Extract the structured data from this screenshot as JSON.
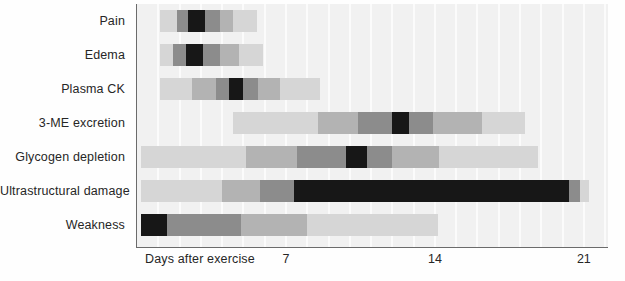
{
  "chart_data": {
    "type": "bar",
    "chart_style": "horizontal-gantt-intensity",
    "title": "",
    "xlabel": "Days after exercise",
    "ylabel": "",
    "xlim": [
      0,
      22.1
    ],
    "grid": true,
    "grid_interval_days": 1,
    "legend": "none",
    "axis_caption": "Days after exercise",
    "xticks": [
      7,
      14,
      21
    ],
    "xtick_labels": [
      "7",
      "14",
      "21"
    ],
    "categories": [
      "Pain",
      "Edema",
      "Plasma CK",
      "3-ME excretion",
      "Glycogen depletion",
      "Ultrastructural damage",
      "Weakness"
    ],
    "intensity_levels": {
      "none": "#f1f1f1",
      "low": "#d6d6d6",
      "moderate": "#b3b3b3",
      "high": "#8c8c8c",
      "peak": "#171717"
    },
    "series": [
      {
        "name": "Pain",
        "start_day": 1.1,
        "end_day": 5.6,
        "segments": [
          {
            "start_day": 1.1,
            "end_day": 1.9,
            "level": "low",
            "color": "#d6d6d6"
          },
          {
            "start_day": 1.9,
            "end_day": 2.4,
            "level": "high",
            "color": "#8c8c8c"
          },
          {
            "start_day": 2.4,
            "end_day": 3.2,
            "level": "peak",
            "color": "#171717"
          },
          {
            "start_day": 3.2,
            "end_day": 3.9,
            "level": "high",
            "color": "#8c8c8c"
          },
          {
            "start_day": 3.9,
            "end_day": 4.5,
            "level": "moderate",
            "color": "#b3b3b3"
          },
          {
            "start_day": 4.5,
            "end_day": 5.6,
            "level": "low",
            "color": "#d6d6d6"
          }
        ]
      },
      {
        "name": "Edema",
        "start_day": 1.1,
        "end_day": 5.9,
        "segments": [
          {
            "start_day": 1.1,
            "end_day": 1.7,
            "level": "low",
            "color": "#d6d6d6"
          },
          {
            "start_day": 1.7,
            "end_day": 2.3,
            "level": "high",
            "color": "#8c8c8c"
          },
          {
            "start_day": 2.3,
            "end_day": 3.1,
            "level": "peak",
            "color": "#171717"
          },
          {
            "start_day": 3.1,
            "end_day": 3.9,
            "level": "high",
            "color": "#8c8c8c"
          },
          {
            "start_day": 3.9,
            "end_day": 4.8,
            "level": "moderate",
            "color": "#b3b3b3"
          },
          {
            "start_day": 4.8,
            "end_day": 5.9,
            "level": "low",
            "color": "#d6d6d6"
          }
        ]
      },
      {
        "name": "Plasma CK",
        "start_day": 1.1,
        "end_day": 8.6,
        "segments": [
          {
            "start_day": 1.1,
            "end_day": 2.6,
            "level": "low",
            "color": "#d6d6d6"
          },
          {
            "start_day": 2.6,
            "end_day": 3.7,
            "level": "moderate",
            "color": "#b3b3b3"
          },
          {
            "start_day": 3.7,
            "end_day": 4.3,
            "level": "high",
            "color": "#8c8c8c"
          },
          {
            "start_day": 4.3,
            "end_day": 5.0,
            "level": "peak",
            "color": "#171717"
          },
          {
            "start_day": 5.0,
            "end_day": 5.7,
            "level": "high",
            "color": "#8c8c8c"
          },
          {
            "start_day": 5.7,
            "end_day": 6.7,
            "level": "moderate",
            "color": "#b3b3b3"
          },
          {
            "start_day": 6.7,
            "end_day": 8.6,
            "level": "low",
            "color": "#d6d6d6"
          }
        ]
      },
      {
        "name": "3-ME excretion",
        "start_day": 4.5,
        "end_day": 18.2,
        "segments": [
          {
            "start_day": 4.5,
            "end_day": 8.5,
            "level": "low",
            "color": "#d6d6d6"
          },
          {
            "start_day": 8.5,
            "end_day": 10.4,
            "level": "moderate",
            "color": "#b3b3b3"
          },
          {
            "start_day": 10.4,
            "end_day": 12.0,
            "level": "high",
            "color": "#8c8c8c"
          },
          {
            "start_day": 12.0,
            "end_day": 12.8,
            "level": "peak",
            "color": "#171717"
          },
          {
            "start_day": 12.8,
            "end_day": 13.9,
            "level": "high",
            "color": "#8c8c8c"
          },
          {
            "start_day": 13.9,
            "end_day": 16.2,
            "level": "moderate",
            "color": "#b3b3b3"
          },
          {
            "start_day": 16.2,
            "end_day": 18.2,
            "level": "low",
            "color": "#d6d6d6"
          }
        ]
      },
      {
        "name": "Glycogen depletion",
        "start_day": 0.2,
        "end_day": 18.8,
        "segments": [
          {
            "start_day": 0.2,
            "end_day": 5.1,
            "level": "low",
            "color": "#d6d6d6"
          },
          {
            "start_day": 5.1,
            "end_day": 7.5,
            "level": "moderate",
            "color": "#b3b3b3"
          },
          {
            "start_day": 7.5,
            "end_day": 9.8,
            "level": "high",
            "color": "#8c8c8c"
          },
          {
            "start_day": 9.8,
            "end_day": 10.8,
            "level": "peak",
            "color": "#171717"
          },
          {
            "start_day": 10.8,
            "end_day": 12.0,
            "level": "high",
            "color": "#8c8c8c"
          },
          {
            "start_day": 12.0,
            "end_day": 14.2,
            "level": "moderate",
            "color": "#b3b3b3"
          },
          {
            "start_day": 14.2,
            "end_day": 18.8,
            "level": "low",
            "color": "#d6d6d6"
          }
        ]
      },
      {
        "name": "Ultrastructural damage",
        "start_day": 0.2,
        "end_day": 21.2,
        "segments": [
          {
            "start_day": 0.2,
            "end_day": 4.0,
            "level": "low",
            "color": "#d6d6d6"
          },
          {
            "start_day": 4.0,
            "end_day": 5.8,
            "level": "moderate",
            "color": "#b3b3b3"
          },
          {
            "start_day": 5.8,
            "end_day": 7.4,
            "level": "high",
            "color": "#8c8c8c"
          },
          {
            "start_day": 7.4,
            "end_day": 20.3,
            "level": "peak",
            "color": "#171717"
          },
          {
            "start_day": 20.3,
            "end_day": 20.8,
            "level": "high",
            "color": "#8c8c8c"
          },
          {
            "start_day": 20.8,
            "end_day": 21.2,
            "level": "low",
            "color": "#d6d6d6"
          }
        ]
      },
      {
        "name": "Weakness",
        "start_day": 0.2,
        "end_day": 14.1,
        "segments": [
          {
            "start_day": 0.2,
            "end_day": 1.4,
            "level": "peak",
            "color": "#171717"
          },
          {
            "start_day": 1.4,
            "end_day": 4.9,
            "level": "high",
            "color": "#8c8c8c"
          },
          {
            "start_day": 4.9,
            "end_day": 8.0,
            "level": "moderate",
            "color": "#b3b3b3"
          },
          {
            "start_day": 8.0,
            "end_day": 14.1,
            "level": "low",
            "color": "#d6d6d6"
          }
        ]
      }
    ]
  },
  "axis": {
    "caption": "Days after exercise",
    "ticks": [
      "7",
      "14",
      "21"
    ]
  }
}
